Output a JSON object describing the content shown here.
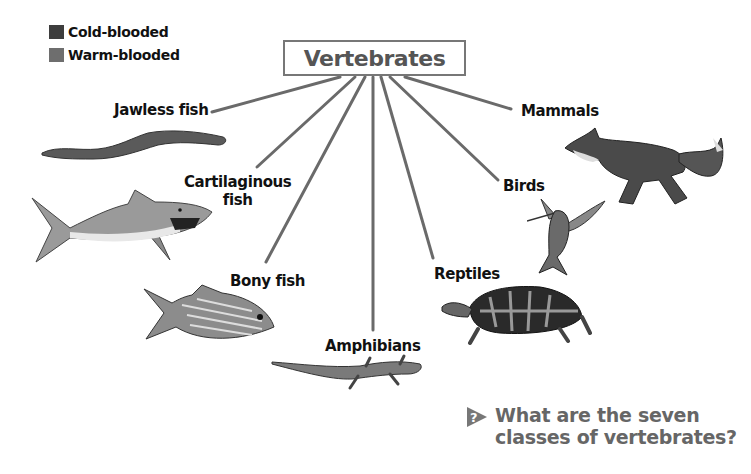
{
  "legend": {
    "items": [
      {
        "label": "Cold-blooded",
        "color": "#3d3d3d"
      },
      {
        "label": "Warm-blooded",
        "color": "#6e6e6e"
      }
    ]
  },
  "title": "Vertebrates",
  "classes": [
    {
      "id": "jawless-fish",
      "label": "Jawless fish",
      "animal": "lamprey"
    },
    {
      "id": "cartilaginous-fish",
      "label_line1": "Cartilaginous",
      "label_line2": "fish",
      "animal": "shark"
    },
    {
      "id": "bony-fish",
      "label": "Bony fish",
      "animal": "striped fish"
    },
    {
      "id": "amphibians",
      "label": "Amphibians",
      "animal": "salamander"
    },
    {
      "id": "reptiles",
      "label": "Reptiles",
      "animal": "box turtle"
    },
    {
      "id": "birds",
      "label": "Birds",
      "animal": "hummingbird"
    },
    {
      "id": "mammals",
      "label": "Mammals",
      "animal": "fox"
    }
  ],
  "question": {
    "line1": "What are the seven",
    "line2": "classes of vertebrates?",
    "icon_glyph": "?"
  },
  "colors": {
    "line": "#6a6a6a",
    "title_border": "#777777",
    "title_text": "#555555",
    "question_text": "#666666"
  }
}
